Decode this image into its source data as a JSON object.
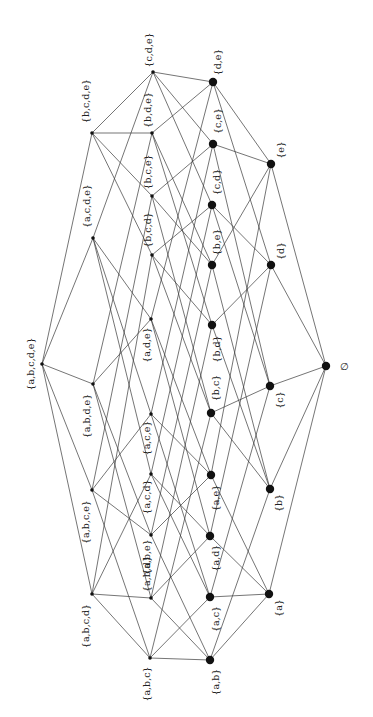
{
  "diagram": {
    "rotation_deg": -90,
    "colors": {
      "edge": "#3a3a3a",
      "node": "#111111",
      "label": "#222222",
      "background": "#ffffff"
    },
    "nodes": [
      {
        "id": "abcde",
        "label": "{a,b,c,d,e}",
        "x": 42,
        "y": 364,
        "size": "small",
        "lx": 30,
        "ly": 364
      },
      {
        "id": "abcd",
        "label": "{a,b,c,d}",
        "x": 92,
        "y": 594,
        "size": "small",
        "lx": 85,
        "ly": 626
      },
      {
        "id": "abce",
        "label": "{a,b,c,e}",
        "x": 92,
        "y": 490,
        "size": "small",
        "lx": 85,
        "ly": 522
      },
      {
        "id": "abde",
        "label": "{a,b,d,e}",
        "x": 93,
        "y": 384,
        "size": "small",
        "lx": 86,
        "ly": 416
      },
      {
        "id": "acde",
        "label": "{a,c,d,e}",
        "x": 93,
        "y": 238,
        "size": "small",
        "lx": 86,
        "ly": 206
      },
      {
        "id": "bcde",
        "label": "{b,c,d,e}",
        "x": 92,
        "y": 133,
        "size": "small",
        "lx": 85,
        "ly": 101
      },
      {
        "id": "abc",
        "label": "{a,b,c}",
        "x": 150,
        "y": 658,
        "size": "small",
        "lx": 146,
        "ly": 684
      },
      {
        "id": "abd",
        "label": "{a,b,d}",
        "x": 151,
        "y": 598,
        "size": "small",
        "lx": 146,
        "ly": 574
      },
      {
        "id": "abe",
        "label": "{a,b,e}",
        "x": 151,
        "y": 535,
        "size": "small",
        "lx": 146,
        "ly": 557
      },
      {
        "id": "acd",
        "label": "{a,c,d}",
        "x": 151,
        "y": 474,
        "size": "small",
        "lx": 146,
        "ly": 497
      },
      {
        "id": "ace",
        "label": "{a,c,e}",
        "x": 151,
        "y": 414,
        "size": "small",
        "lx": 146,
        "ly": 438
      },
      {
        "id": "ade",
        "label": "{a,d,e}",
        "x": 151,
        "y": 319,
        "size": "small",
        "lx": 146,
        "ly": 345
      },
      {
        "id": "bcd",
        "label": "{b,c,d}",
        "x": 152,
        "y": 255,
        "size": "small",
        "lx": 147,
        "ly": 230
      },
      {
        "id": "bce",
        "label": "{b,c,e}",
        "x": 152,
        "y": 196,
        "size": "small",
        "lx": 147,
        "ly": 172
      },
      {
        "id": "bde",
        "label": "{b,d,e}",
        "x": 152,
        "y": 133,
        "size": "small",
        "lx": 147,
        "ly": 110
      },
      {
        "id": "cde",
        "label": "{c,d,e}",
        "x": 153,
        "y": 72,
        "size": "small",
        "lx": 148,
        "ly": 50
      },
      {
        "id": "ab",
        "label": "{a,b}",
        "x": 210,
        "y": 660,
        "size": "big",
        "lx": 215,
        "ly": 682
      },
      {
        "id": "ac",
        "label": "{a,c}",
        "x": 210,
        "y": 597,
        "size": "big",
        "lx": 215,
        "ly": 619
      },
      {
        "id": "ad",
        "label": "{a,d}",
        "x": 210,
        "y": 536,
        "size": "big",
        "lx": 215,
        "ly": 558
      },
      {
        "id": "ae",
        "label": "{a,e}",
        "x": 211,
        "y": 475,
        "size": "big",
        "lx": 215,
        "ly": 498
      },
      {
        "id": "bc",
        "label": "{b,c}",
        "x": 211,
        "y": 413,
        "size": "big",
        "lx": 215,
        "ly": 388
      },
      {
        "id": "bd",
        "label": "{b,d}",
        "x": 212,
        "y": 325,
        "size": "big",
        "lx": 216,
        "ly": 349
      },
      {
        "id": "be",
        "label": "{b,e}",
        "x": 212,
        "y": 265,
        "size": "big",
        "lx": 216,
        "ly": 242
      },
      {
        "id": "cd",
        "label": "{c,d}",
        "x": 212,
        "y": 205,
        "size": "big",
        "lx": 216,
        "ly": 182
      },
      {
        "id": "ce",
        "label": "{c,e}",
        "x": 213,
        "y": 144,
        "size": "big",
        "lx": 217,
        "ly": 121
      },
      {
        "id": "de",
        "label": "{d,e}",
        "x": 213,
        "y": 82,
        "size": "big",
        "lx": 217,
        "ly": 62
      },
      {
        "id": "a",
        "label": "{a}",
        "x": 269,
        "y": 594,
        "size": "big",
        "lx": 278,
        "ly": 608
      },
      {
        "id": "b",
        "label": "{b}",
        "x": 270,
        "y": 489,
        "size": "big",
        "lx": 278,
        "ly": 503
      },
      {
        "id": "c",
        "label": "{c}",
        "x": 270,
        "y": 386,
        "size": "big",
        "lx": 279,
        "ly": 400
      },
      {
        "id": "d",
        "label": "{d}",
        "x": 271,
        "y": 265,
        "size": "big",
        "lx": 280,
        "ly": 251
      },
      {
        "id": "e",
        "label": "{e}",
        "x": 271,
        "y": 164,
        "size": "big",
        "lx": 280,
        "ly": 150
      },
      {
        "id": "empty",
        "label": "∅",
        "x": 326,
        "y": 366,
        "size": "big",
        "lx": 344,
        "ly": 366
      }
    ],
    "edges": [
      [
        "abcde",
        "abcd"
      ],
      [
        "abcde",
        "abce"
      ],
      [
        "abcde",
        "abde"
      ],
      [
        "abcde",
        "acde"
      ],
      [
        "abcde",
        "bcde"
      ],
      [
        "abcd",
        "abc"
      ],
      [
        "abcd",
        "abd"
      ],
      [
        "abcd",
        "acd"
      ],
      [
        "abcd",
        "bcd"
      ],
      [
        "abce",
        "abc"
      ],
      [
        "abce",
        "abe"
      ],
      [
        "abce",
        "ace"
      ],
      [
        "abce",
        "bce"
      ],
      [
        "abde",
        "abd"
      ],
      [
        "abde",
        "abe"
      ],
      [
        "abde",
        "ade"
      ],
      [
        "abde",
        "bde"
      ],
      [
        "acde",
        "acd"
      ],
      [
        "acde",
        "ace"
      ],
      [
        "acde",
        "ade"
      ],
      [
        "acde",
        "cde"
      ],
      [
        "bcde",
        "bcd"
      ],
      [
        "bcde",
        "bce"
      ],
      [
        "bcde",
        "bde"
      ],
      [
        "bcde",
        "cde"
      ],
      [
        "abc",
        "ab"
      ],
      [
        "abc",
        "ac"
      ],
      [
        "abc",
        "bc"
      ],
      [
        "abd",
        "ab"
      ],
      [
        "abd",
        "ad"
      ],
      [
        "abd",
        "bd"
      ],
      [
        "abe",
        "ab"
      ],
      [
        "abe",
        "ae"
      ],
      [
        "abe",
        "be"
      ],
      [
        "acd",
        "ac"
      ],
      [
        "acd",
        "ad"
      ],
      [
        "acd",
        "cd"
      ],
      [
        "ace",
        "ac"
      ],
      [
        "ace",
        "ae"
      ],
      [
        "ace",
        "ce"
      ],
      [
        "ade",
        "ad"
      ],
      [
        "ade",
        "ae"
      ],
      [
        "ade",
        "de"
      ],
      [
        "bcd",
        "bc"
      ],
      [
        "bcd",
        "bd"
      ],
      [
        "bcd",
        "cd"
      ],
      [
        "bce",
        "bc"
      ],
      [
        "bce",
        "be"
      ],
      [
        "bce",
        "ce"
      ],
      [
        "bde",
        "bd"
      ],
      [
        "bde",
        "be"
      ],
      [
        "bde",
        "de"
      ],
      [
        "cde",
        "cd"
      ],
      [
        "cde",
        "ce"
      ],
      [
        "cde",
        "de"
      ],
      [
        "ab",
        "a"
      ],
      [
        "ab",
        "b"
      ],
      [
        "ac",
        "a"
      ],
      [
        "ac",
        "c"
      ],
      [
        "ad",
        "a"
      ],
      [
        "ad",
        "d"
      ],
      [
        "ae",
        "a"
      ],
      [
        "ae",
        "e"
      ],
      [
        "bc",
        "b"
      ],
      [
        "bc",
        "c"
      ],
      [
        "bd",
        "b"
      ],
      [
        "bd",
        "d"
      ],
      [
        "be",
        "b"
      ],
      [
        "be",
        "e"
      ],
      [
        "cd",
        "c"
      ],
      [
        "cd",
        "d"
      ],
      [
        "ce",
        "c"
      ],
      [
        "ce",
        "e"
      ],
      [
        "de",
        "d"
      ],
      [
        "de",
        "e"
      ],
      [
        "a",
        "empty"
      ],
      [
        "b",
        "empty"
      ],
      [
        "c",
        "empty"
      ],
      [
        "d",
        "empty"
      ],
      [
        "e",
        "empty"
      ]
    ]
  }
}
